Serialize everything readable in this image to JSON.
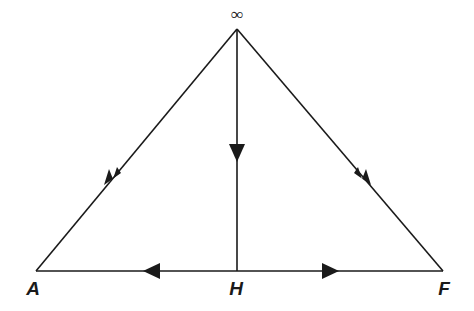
{
  "figure": {
    "type": "geometry-diagram",
    "caption": "",
    "background_color": "#ffffff",
    "stroke_color": "#1a1a1a",
    "labels": {
      "apex": "∞",
      "left_vertex": "A",
      "base_midpoint": "H",
      "right_vertex": "F"
    },
    "points": [
      {
        "name": "apex",
        "label": "∞",
        "x": 237,
        "y": 29
      },
      {
        "name": "left-vertex",
        "label": "A",
        "x": 36,
        "y": 271
      },
      {
        "name": "base-midpoint",
        "label": "H",
        "x": 237,
        "y": 271
      },
      {
        "name": "right-vertex",
        "label": "F",
        "x": 443,
        "y": 271
      }
    ],
    "segments": [
      {
        "name": "left-edge",
        "from": "apex",
        "to": "left-vertex",
        "direction": "down-left",
        "arrow_at": {
          "x": 112,
          "y": 176
        }
      },
      {
        "name": "right-edge",
        "from": "apex",
        "to": "right-vertex",
        "direction": "down-right",
        "arrow_at": {
          "x": 363,
          "y": 176
        }
      },
      {
        "name": "altitude",
        "from": "apex",
        "to": "base-midpoint",
        "direction": "down",
        "arrow_at": {
          "x": 237,
          "y": 152
        }
      },
      {
        "name": "base-left",
        "from": "base-midpoint",
        "to": "left-vertex",
        "direction": "left",
        "arrow_at": {
          "x": 152,
          "y": 271
        }
      },
      {
        "name": "base-right",
        "from": "base-midpoint",
        "to": "right-vertex",
        "direction": "right",
        "arrow_at": {
          "x": 330,
          "y": 271
        }
      }
    ],
    "label_positions": {
      "infinity": {
        "x": 237,
        "y": 20
      },
      "A": {
        "x": 33,
        "y": 295
      },
      "H": {
        "x": 236,
        "y": 295
      },
      "F": {
        "x": 444,
        "y": 295
      }
    }
  }
}
